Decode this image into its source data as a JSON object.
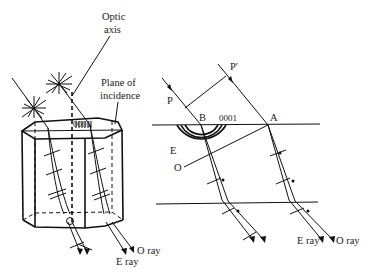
{
  "left_figure": {
    "labels": {
      "optic_axis_line1": "Optic",
      "optic_axis_line2": "axis",
      "plane_line1": "Plane of",
      "plane_line2": "incidence",
      "face": "0001",
      "o_ray": "O ray",
      "e_ray": "E ray"
    }
  },
  "right_figure": {
    "labels": {
      "p_prime": "P′",
      "p": "P",
      "b": "B",
      "face": "0001",
      "a": "A",
      "e": "E",
      "o": "O",
      "e_ray": "E ray",
      "o_ray": "O ray"
    }
  }
}
